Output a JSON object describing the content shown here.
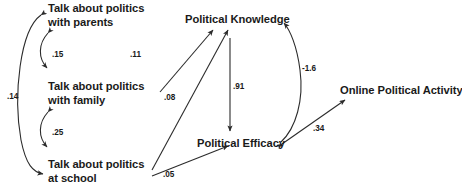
{
  "diagram": {
    "type": "path-diagram",
    "title": "",
    "nodes": [
      {
        "id": "talk_parents",
        "label": "Talk about politics\nwith parents",
        "x": 48,
        "y": 2
      },
      {
        "id": "talk_family",
        "label": "Talk about politics\nwith family",
        "x": 48,
        "y": 80
      },
      {
        "id": "talk_school",
        "label": "Talk about politics\nat school",
        "x": 48,
        "y": 158
      },
      {
        "id": "political_knowledge",
        "label": "Political Knowledge",
        "x": 185,
        "y": 13
      },
      {
        "id": "political_efficacy",
        "label": "Political Efficacy",
        "x": 197,
        "y": 137
      },
      {
        "id": "online_political_activity",
        "label": "Online Political Activity",
        "x": 340,
        "y": 84
      }
    ],
    "edges": [
      {
        "id": "e_parents_school",
        "label": ".14",
        "from": "talk_parents",
        "to": "talk_school",
        "kind": "double-curved",
        "label_x": 7,
        "label_y": 92
      },
      {
        "id": "e_parents_family",
        "label": ".15",
        "from": "talk_parents",
        "to": "talk_family",
        "kind": "double-curved",
        "label_x": 52,
        "label_y": 50
      },
      {
        "id": "e_family_school",
        "label": ".25",
        "from": "talk_family",
        "to": "talk_school",
        "kind": "double-curved",
        "label_x": 52,
        "label_y": 128
      },
      {
        "id": "e_family_knowledge",
        "label": ".11",
        "from": "talk_family",
        "to": "political_knowledge",
        "kind": "straight",
        "label_x": 130,
        "label_y": 50
      },
      {
        "id": "e_school_knowledge",
        "label": ".08",
        "from": "talk_school",
        "to": "political_knowledge",
        "kind": "straight",
        "label_x": 164,
        "label_y": 93
      },
      {
        "id": "e_school_efficacy",
        "label": ".05",
        "from": "talk_school",
        "to": "political_efficacy",
        "kind": "straight",
        "label_x": 163,
        "label_y": 170
      },
      {
        "id": "e_knowledge_efficacy",
        "label": ".91",
        "from": "political_knowledge",
        "to": "political_efficacy",
        "kind": "straight-vertical",
        "label_x": 233,
        "label_y": 82
      },
      {
        "id": "e_activity_knowledge",
        "label": "-1.6",
        "from": "political_efficacy",
        "to": "political_knowledge",
        "kind": "curved",
        "label_x": 302,
        "label_y": 64
      },
      {
        "id": "e_efficacy_activity",
        "label": ".34",
        "from": "political_efficacy",
        "to": "online_political_activity",
        "kind": "straight",
        "label_x": 313,
        "label_y": 124
      }
    ],
    "stroke_color": "#2b2b2b",
    "text_color": "#1a1a1a",
    "background": "#ffffff"
  }
}
